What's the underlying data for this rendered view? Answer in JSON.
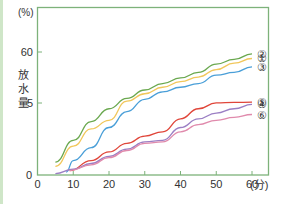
{
  "chart_data": {
    "type": "line",
    "title": "",
    "xlabel": "(分)",
    "ylabel": "放水量",
    "yunit": "(%)",
    "xlim": [
      0,
      60
    ],
    "x_ticks": [
      "0",
      "10",
      "20",
      "30",
      "40",
      "50",
      "60"
    ],
    "y_ticks": [
      "0",
      "5",
      "60"
    ],
    "y_scale": "broken (0–5 and 5–60 segments)",
    "grid": false,
    "legend": "inline labels at line ends (right)",
    "series": [
      {
        "name": "②",
        "color": "#6aa84f",
        "x": [
          5,
          10,
          15,
          20,
          25,
          30,
          35,
          40,
          45,
          50,
          55,
          60
        ],
        "y": [
          0.9,
          2.4,
          3.7,
          4.6,
          10,
          19,
          26,
          32,
          38,
          47,
          52,
          58
        ]
      },
      {
        "name": "①",
        "color": "#f1c75b",
        "x": [
          5,
          10,
          15,
          20,
          25,
          30,
          35,
          40,
          45,
          50,
          55,
          60
        ],
        "y": [
          0.6,
          2.0,
          3.2,
          3.8,
          7,
          15,
          22,
          28,
          33,
          41,
          48,
          53
        ]
      },
      {
        "name": "③",
        "color": "#4a9fd8",
        "x": [
          8,
          10,
          15,
          20,
          25,
          30,
          35,
          40,
          45,
          50,
          55,
          60
        ],
        "y": [
          0.2,
          1.0,
          1.9,
          3.3,
          4.4,
          9,
          17,
          22,
          26,
          35,
          38,
          44
        ]
      },
      {
        "name": "⑤",
        "color": "#e0463a",
        "x": [
          9,
          15,
          20,
          25,
          30,
          35,
          40,
          45,
          50,
          55,
          60
        ],
        "y": [
          0.3,
          1.0,
          1.6,
          2.2,
          2.7,
          3.0,
          3.9,
          4.6,
          5.1,
          5.6,
          5.9
        ]
      },
      {
        "name": "④",
        "color": "#9b7fc4",
        "x": [
          5,
          10,
          15,
          20,
          25,
          30,
          35,
          40,
          45,
          50,
          55,
          60
        ],
        "y": [
          0.1,
          0.4,
          0.8,
          1.3,
          1.8,
          2.3,
          2.4,
          3.3,
          3.9,
          4.3,
          4.6,
          4.9
        ]
      },
      {
        "name": "⑥",
        "color": "#e08aac",
        "x": [
          9,
          15,
          20,
          25,
          30,
          35,
          40,
          45,
          50,
          55,
          60
        ],
        "y": [
          0.3,
          0.7,
          1.2,
          1.7,
          2.2,
          2.3,
          3.0,
          3.5,
          3.8,
          4.0,
          4.2
        ]
      }
    ]
  }
}
